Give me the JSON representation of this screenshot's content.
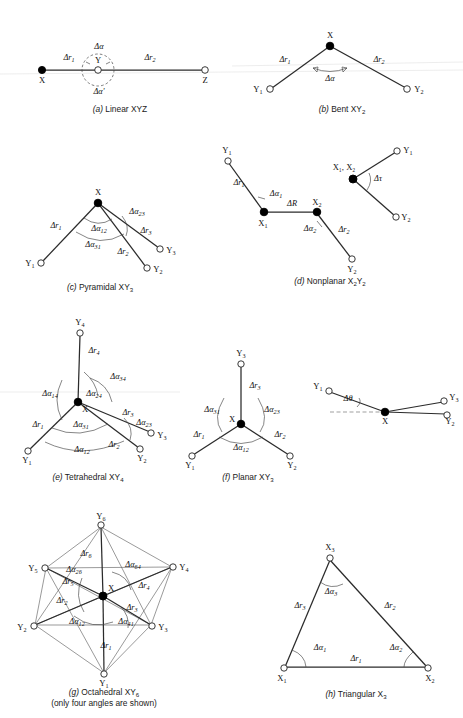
{
  "figure": {
    "panels": [
      {
        "id": "a",
        "caption_letter": "(a)",
        "caption_text": "Linear XYZ",
        "atoms": [
          {
            "name": "X",
            "type": "filled"
          },
          {
            "name": "Y",
            "type": "open"
          },
          {
            "name": "Z",
            "type": "open"
          }
        ],
        "coordinates": [
          "Δr₁",
          "Δr₂",
          "Δα",
          "Δα'"
        ]
      },
      {
        "id": "b",
        "caption_letter": "(b)",
        "caption_text": "Bent XY₂",
        "atoms": [
          {
            "name": "X",
            "type": "filled"
          },
          {
            "name": "Y₁",
            "type": "open"
          },
          {
            "name": "Y₂",
            "type": "open"
          }
        ],
        "coordinates": [
          "Δr₁",
          "Δr₂",
          "Δα"
        ]
      },
      {
        "id": "c",
        "caption_letter": "(c)",
        "caption_text": "Pyramidal XY₃",
        "atoms": [
          {
            "name": "X",
            "type": "filled"
          },
          {
            "name": "Y₁",
            "type": "open"
          },
          {
            "name": "Y₂",
            "type": "open"
          },
          {
            "name": "Y₃",
            "type": "open"
          }
        ],
        "coordinates": [
          "Δr₁",
          "Δr₂",
          "Δr₃",
          "Δα₁₂",
          "Δα₂₃",
          "Δα₃₁"
        ]
      },
      {
        "id": "d",
        "caption_letter": "(d)",
        "caption_text": "Nonplanar X₂Y₂",
        "atoms": [
          {
            "name": "X₁",
            "type": "filled"
          },
          {
            "name": "X₂",
            "type": "filled"
          },
          {
            "name": "Y₁",
            "type": "open"
          },
          {
            "name": "Y₂",
            "type": "open"
          }
        ],
        "newman_label": "X₁, X₂",
        "coordinates": [
          "Δr₁",
          "Δr₂",
          "ΔR",
          "Δα₁",
          "Δα₂",
          "Δτ"
        ]
      },
      {
        "id": "e",
        "caption_letter": "(e)",
        "caption_text": "Tetrahedral XY₄",
        "atoms": [
          {
            "name": "X",
            "type": "filled"
          },
          {
            "name": "Y₁",
            "type": "open"
          },
          {
            "name": "Y₂",
            "type": "open"
          },
          {
            "name": "Y₃",
            "type": "open"
          },
          {
            "name": "Y₄",
            "type": "open"
          }
        ],
        "coordinates": [
          "Δr₁",
          "Δr₂",
          "Δr₃",
          "Δr₄",
          "Δα₁₂",
          "Δα₂₃",
          "Δα₃₁",
          "Δα₁₄",
          "Δα₂₄",
          "Δα₃₄"
        ]
      },
      {
        "id": "f",
        "caption_letter": "(f)",
        "caption_text": "Planar XY₃",
        "atoms": [
          {
            "name": "X",
            "type": "filled"
          },
          {
            "name": "Y₁",
            "type": "open"
          },
          {
            "name": "Y₂",
            "type": "open"
          },
          {
            "name": "Y₃",
            "type": "open"
          }
        ],
        "coordinates": [
          "Δr₁",
          "Δr₂",
          "Δr₃",
          "Δα₁₂",
          "Δα₂₃",
          "Δα₃₁"
        ],
        "oop": {
          "coordinates": [
            "Δθ"
          ],
          "atoms": [
            {
              "name": "X",
              "type": "filled"
            },
            {
              "name": "Y₁",
              "type": "open"
            },
            {
              "name": "Y₂",
              "type": "open"
            },
            {
              "name": "Y₃",
              "type": "open"
            }
          ]
        }
      },
      {
        "id": "g",
        "caption_letter": "(g)",
        "caption_text": "Octahedral XY₆",
        "caption_note": "(only four angles are shown)",
        "atoms": [
          {
            "name": "X",
            "type": "filled"
          },
          {
            "name": "Y₁",
            "type": "open"
          },
          {
            "name": "Y₂",
            "type": "open"
          },
          {
            "name": "Y₃",
            "type": "open"
          },
          {
            "name": "Y₄",
            "type": "open"
          },
          {
            "name": "Y₅",
            "type": "open"
          },
          {
            "name": "Y₆",
            "type": "open"
          }
        ],
        "coordinates": [
          "Δr₁",
          "Δr₂",
          "Δr₃",
          "Δr₄",
          "Δr₅",
          "Δr₆",
          "Δα₁₂",
          "Δα₂₆",
          "Δα₄₁",
          "Δα₆₄"
        ]
      },
      {
        "id": "h",
        "caption_letter": "(h)",
        "caption_text": "Triangular X₃",
        "atoms": [
          {
            "name": "X₁",
            "type": "open"
          },
          {
            "name": "X₂",
            "type": "open"
          },
          {
            "name": "X₃",
            "type": "open"
          }
        ],
        "coordinates": [
          "Δr₁",
          "Δr₂",
          "Δr₃",
          "Δα₁",
          "Δα₂",
          "Δα₃"
        ]
      }
    ]
  },
  "labels": {
    "a": {
      "X": "X",
      "Y": "Y",
      "Z": "Z",
      "dr1": "Δr",
      "dr1s": "1",
      "dr2": "Δr",
      "dr2s": "2",
      "da": "Δα",
      "dap": "Δα'",
      "caption_letter": "(a)",
      "caption_text": "Linear XYZ"
    },
    "b": {
      "X": "X",
      "Y1": "Y",
      "Y1s": "1",
      "Y2": "Y",
      "Y2s": "2",
      "dr1": "Δr",
      "dr1s": "1",
      "dr2": "Δr",
      "dr2s": "2",
      "da": "Δα",
      "caption_letter": "(b)",
      "caption_text": "Bent XY",
      "caption_sub": "2"
    },
    "c": {
      "X": "X",
      "Y1": "Y",
      "Y1s": "1",
      "Y2": "Y",
      "Y2s": "2",
      "Y3": "Y",
      "Y3s": "3",
      "dr1": "Δr",
      "dr1s": "1",
      "dr2": "Δr",
      "dr2s": "2",
      "dr3": "Δr",
      "dr3s": "3",
      "da12": "Δα",
      "da12s": "12",
      "da23": "Δα",
      "da23s": "23",
      "da31": "Δα",
      "da31s": "31",
      "caption_letter": "(c)",
      "caption_text": "Pyramidal XY",
      "caption_sub": "3"
    },
    "d": {
      "X1": "X",
      "X1s": "1",
      "X2": "X",
      "X2s": "2",
      "Y1": "Y",
      "Y1s": "1",
      "Y2": "Y",
      "Y2s": "2",
      "newman": "X₁, X₂",
      "dr1": "Δr",
      "dr1s": "1",
      "dr2": "Δr",
      "dr2s": "2",
      "dR": "ΔR",
      "da1": "Δα",
      "da1s": "1",
      "da2": "Δα",
      "da2s": "2",
      "dtau": "Δτ",
      "nY1": "Y",
      "nY1s": "1",
      "nY2": "Y",
      "nY2s": "2",
      "caption_letter": "(d)",
      "caption_text": "Nonplanar X",
      "caption_sub": "2",
      "caption_text2": "Y",
      "caption_sub2": "2"
    },
    "e": {
      "X": "X",
      "Y1": "Y",
      "Y1s": "1",
      "Y2": "Y",
      "Y2s": "2",
      "Y3": "Y",
      "Y3s": "3",
      "Y4": "Y",
      "Y4s": "4",
      "dr1": "Δr",
      "dr1s": "1",
      "dr2": "Δr",
      "dr2s": "2",
      "dr3": "Δr",
      "dr3s": "3",
      "dr4": "Δr",
      "dr4s": "4",
      "da12": "Δα",
      "da12s": "12",
      "da23": "Δα",
      "da23s": "23",
      "da31": "Δα",
      "da31s": "31",
      "da14": "Δα",
      "da14s": "14",
      "da24": "Δα",
      "da24s": "24",
      "da34": "Δα",
      "da34s": "34",
      "caption_letter": "(e)",
      "caption_text": "Tetrahedral XY",
      "caption_sub": "4"
    },
    "f": {
      "X": "X",
      "Y1": "Y",
      "Y1s": "1",
      "Y2": "Y",
      "Y2s": "2",
      "Y3": "Y",
      "Y3s": "3",
      "dr1": "Δr",
      "dr1s": "1",
      "dr2": "Δr",
      "dr2s": "2",
      "dr3": "Δr",
      "dr3s": "3",
      "da12": "Δα",
      "da12s": "12",
      "da23": "Δα",
      "da23s": "23",
      "da31": "Δα",
      "da31s": "31",
      "caption_letter": "(f)",
      "caption_text": "Planar XY",
      "caption_sub": "3",
      "oX": "X",
      "oY1": "Y",
      "oY1s": "1",
      "oY2": "Y",
      "oY2s": "2",
      "oY3": "Y",
      "oY3s": "3",
      "dtheta": "Δθ"
    },
    "g": {
      "X": "X",
      "Y1": "Y",
      "Y1s": "1",
      "Y2": "Y",
      "Y2s": "2",
      "Y3": "Y",
      "Y3s": "3",
      "Y4": "Y",
      "Y4s": "4",
      "Y5": "Y",
      "Y5s": "5",
      "Y6": "Y",
      "Y6s": "6",
      "dr1": "Δr",
      "dr1s": "1",
      "dr2": "Δr",
      "dr2s": "2",
      "dr3": "Δr",
      "dr3s": "3",
      "dr4": "Δr",
      "dr4s": "4",
      "dr5": "Δr",
      "dr5s": "5",
      "dr6": "Δr",
      "dr6s": "6",
      "da12": "Δα",
      "da12s": "12",
      "da26": "Δα",
      "da26s": "26",
      "da41": "Δα",
      "da41s": "41",
      "da64": "Δα",
      "da64s": "64",
      "caption_letter": "(g)",
      "caption_text": "Octahedral XY",
      "caption_sub": "6",
      "caption_note": "(only four angles are shown)"
    },
    "h": {
      "X1": "X",
      "X1s": "1",
      "X2": "X",
      "X2s": "2",
      "X3": "X",
      "X3s": "3",
      "dr1": "Δr",
      "dr1s": "1",
      "dr2": "Δr",
      "dr2s": "2",
      "dr3": "Δr",
      "dr3s": "3",
      "da1": "Δα",
      "da1s": "1",
      "da2": "Δα",
      "da2s": "2",
      "da3": "Δα",
      "da3s": "3",
      "caption_letter": "(h)",
      "caption_text": "Triangular X",
      "caption_sub": "3"
    }
  }
}
